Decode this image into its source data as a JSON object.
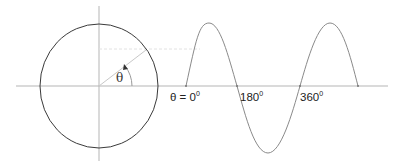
{
  "diagram": {
    "angle_symbol": "θ",
    "labels": {
      "start": {
        "text": "θ = 0",
        "degree": "0"
      },
      "half": {
        "text": "180",
        "degree": "0"
      },
      "full": {
        "text": "360",
        "degree": "0"
      }
    },
    "colors": {
      "circle": "#3a3a3a",
      "axes": "#b5b5b5",
      "sine": "#8a8a8a",
      "radius": "#c8c8c8",
      "projection": "#e2e2e2",
      "text": "#222222"
    }
  }
}
